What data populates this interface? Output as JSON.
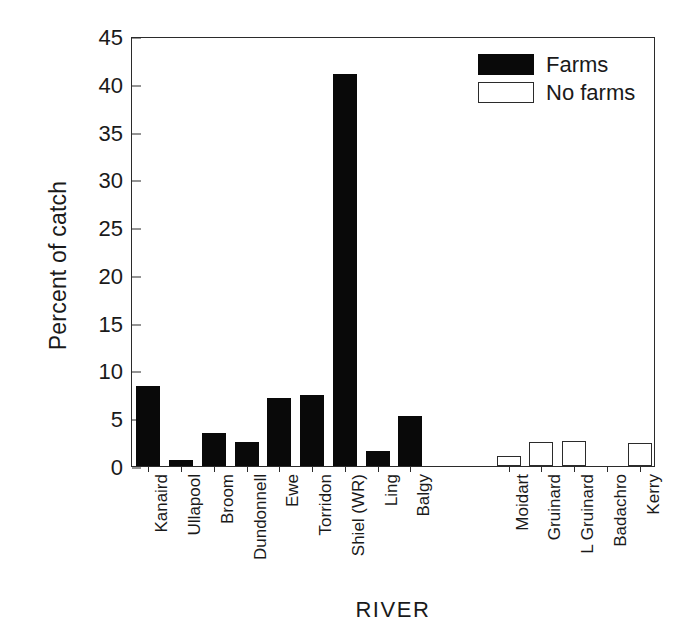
{
  "chart_data": {
    "type": "bar",
    "title": "",
    "xlabel": "RIVER",
    "ylabel": "Percent of catch",
    "ylim": [
      0,
      45
    ],
    "yticks": [
      0,
      5,
      10,
      15,
      20,
      25,
      30,
      35,
      40,
      45
    ],
    "ytick_labels": [
      "0",
      "5",
      "10",
      "15",
      "20",
      "25",
      "30",
      "35",
      "40",
      "45"
    ],
    "grid": false,
    "legend_position": "top-right",
    "categories": [
      "Kanaird",
      "Ullapool",
      "Broom",
      "Dundonnell",
      "Ewe",
      "Torridon",
      "Shiel (WR)",
      "Ling",
      "Balgy",
      "Moidart",
      "Gruinard",
      "L Gruinard",
      "Badachro",
      "Kerry"
    ],
    "values": [
      8.4,
      0.6,
      3.5,
      2.5,
      7.1,
      7.4,
      41.0,
      1.6,
      5.2,
      1.0,
      2.5,
      2.6,
      0.0,
      2.4
    ],
    "groups": [
      "Farms",
      "Farms",
      "Farms",
      "Farms",
      "Farms",
      "Farms",
      "Farms",
      "Farms",
      "Farms",
      "No farms",
      "No farms",
      "No farms",
      "No farms",
      "No farms"
    ],
    "legend": [
      {
        "label": "Farms",
        "color": "#090909",
        "style": "filled"
      },
      {
        "label": "No farms",
        "color": "#ffffff",
        "style": "outlined"
      }
    ],
    "colors": {
      "farms": "#090909",
      "no_farms": "#ffffff",
      "axis": "#2b2b2b",
      "text": "#1a1a1a",
      "background": "#ffffff"
    },
    "bars": [
      {
        "label": "Kanaird",
        "value": 8.4,
        "group": "Farms",
        "x": 0.5
      },
      {
        "label": "Ullapool",
        "value": 0.6,
        "group": "Farms",
        "x": 1.5
      },
      {
        "label": "Broom",
        "value": 3.5,
        "group": "Farms",
        "x": 2.5
      },
      {
        "label": "Dundonnell",
        "value": 2.5,
        "group": "Farms",
        "x": 3.5
      },
      {
        "label": "Ewe",
        "value": 7.1,
        "group": "Farms",
        "x": 4.5
      },
      {
        "label": "Torridon",
        "value": 7.4,
        "group": "Farms",
        "x": 5.5
      },
      {
        "label": "Shiel (WR)",
        "value": 41.0,
        "group": "Farms",
        "x": 6.5
      },
      {
        "label": "Ling",
        "value": 1.6,
        "group": "Farms",
        "x": 7.5
      },
      {
        "label": "Balgy",
        "value": 5.2,
        "group": "Farms",
        "x": 8.5
      },
      {
        "label": "Moidart",
        "value": 1.0,
        "group": "No farms",
        "x": 11.5
      },
      {
        "label": "Gruinard",
        "value": 2.5,
        "group": "No farms",
        "x": 12.5
      },
      {
        "label": "L Gruinard",
        "value": 2.6,
        "group": "No farms",
        "x": 13.5
      },
      {
        "label": "Badachro",
        "value": 0.0,
        "group": "No farms",
        "x": 14.5
      },
      {
        "label": "Kerry",
        "value": 2.4,
        "group": "No farms",
        "x": 15.5
      }
    ]
  }
}
